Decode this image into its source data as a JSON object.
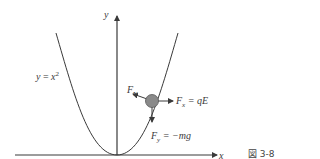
{
  "figure": {
    "caption": "図 3-8",
    "axes": {
      "x_label": "x",
      "y_label": "y"
    },
    "curve_label": {
      "lhs": "y",
      "eq": " = ",
      "base": "x",
      "exp": "2"
    },
    "forces": {
      "normal": {
        "symbol": "F",
        "sub": "N"
      },
      "horizontal": {
        "symbol": "F",
        "sub": "x",
        "rhs": " = qE"
      },
      "vertical": {
        "symbol": "F",
        "sub": "y",
        "rhs": " = −mg"
      }
    },
    "colors": {
      "line": "#3a3a3a",
      "ball": "#8a8a8a",
      "ball_edge": "#555555"
    }
  }
}
